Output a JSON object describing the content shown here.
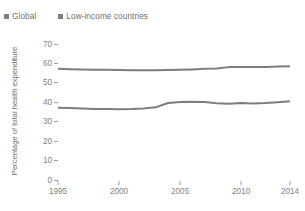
{
  "chart_data": {
    "type": "line",
    "title": "",
    "subtitle": "",
    "xlabel": "",
    "ylabel": "Percentage of total health expenditure",
    "xlim": [
      1995,
      2014
    ],
    "ylim": [
      0,
      70
    ],
    "grid": false,
    "legend_position": "top-left",
    "xticks": [
      1995,
      2000,
      2005,
      2010,
      2014
    ],
    "xtick_labels": [
      "1995",
      "2000",
      "2005",
      "2010",
      "2014"
    ],
    "yticks": [
      0,
      10,
      20,
      30,
      40,
      50,
      60,
      70
    ],
    "ytick_labels": [
      "0",
      "10",
      "20",
      "30",
      "40",
      "50",
      "60",
      "70"
    ],
    "x": [
      1995,
      1996,
      1997,
      1998,
      1999,
      2000,
      2001,
      2002,
      2003,
      2004,
      2005,
      2006,
      2007,
      2008,
      2009,
      2010,
      2011,
      2012,
      2013,
      2014
    ],
    "series": [
      {
        "name": "Global",
        "color": "#7d7d7d",
        "values": [
          57.2,
          57.0,
          56.9,
          56.8,
          56.7,
          56.6,
          56.5,
          56.5,
          56.5,
          56.6,
          56.7,
          56.9,
          57.2,
          57.4,
          58.1,
          58.2,
          58.1,
          58.2,
          58.4,
          58.6
        ]
      },
      {
        "name": "Low-income countries",
        "color": "#7d7d7d",
        "values": [
          37.2,
          37.0,
          36.8,
          36.6,
          36.5,
          36.4,
          36.5,
          36.8,
          37.4,
          39.6,
          40.2,
          40.3,
          40.1,
          39.5,
          39.3,
          39.6,
          39.4,
          39.6,
          40.0,
          40.5
        ]
      }
    ]
  },
  "legend": {
    "items": [
      {
        "label": "Global",
        "color": "#7d7d7d"
      },
      {
        "label": "Low-income countries",
        "color": "#7d7d7d"
      }
    ]
  },
  "axes": {
    "y_title": "Percentage of total health expenditure"
  }
}
